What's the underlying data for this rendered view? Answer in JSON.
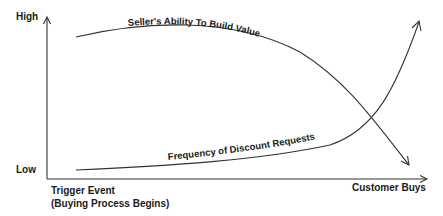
{
  "diagram": {
    "y_axis": {
      "high_label": "High",
      "low_label": "Low"
    },
    "x_axis": {
      "start_label_line1": "Trigger Event",
      "start_label_line2": "(Buying Process Begins)",
      "end_label": "Customer Buys"
    },
    "curves": [
      {
        "id": "seller-ability",
        "label": "Seller's Ability To Build Value",
        "trend": "starts high, stays high, then drops sharply toward the end",
        "arrow": "down-right"
      },
      {
        "id": "discount-requests",
        "label": "Frequency of Discount Requests",
        "trend": "starts low, stays low, then rises sharply toward the end",
        "arrow": "up-right"
      }
    ],
    "colors": {
      "line": "#333333",
      "text": "#1a1a1a",
      "background": "#ffffff"
    }
  }
}
